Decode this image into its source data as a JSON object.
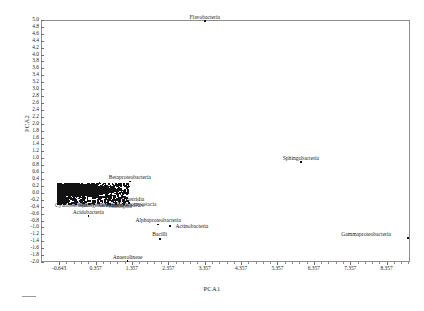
{
  "chart_data": {
    "type": "scatter",
    "title": "",
    "xlabel": "PCA1",
    "ylabel": "PCA2",
    "xlim": [
      -1.143,
      9.0
    ],
    "ylim": [
      -2.0,
      5.0
    ],
    "grid": false,
    "legend": "none",
    "xticks": [
      "-0.643",
      "0.357",
      "1.357",
      "2.357",
      "3.357",
      "4.357",
      "5.357",
      "6.357",
      "7.357",
      "8.357"
    ],
    "xtick_values": [
      -0.643,
      0.357,
      1.357,
      2.357,
      3.357,
      4.357,
      5.357,
      6.357,
      7.357,
      8.357
    ],
    "yticks": [
      "5.0",
      "4.8",
      "4.6",
      "4.4",
      "4.2",
      "4.0",
      "3.8",
      "3.6",
      "3.4",
      "3.2",
      "3.0",
      "2.8",
      "2.6",
      "2.4",
      "2.2",
      "2.0",
      "1.8",
      "1.6",
      "1.4",
      "1.2",
      "1.0",
      "0.8",
      "0.6",
      "0.4",
      "0.2",
      "0.0",
      "-0.2",
      "-0.4",
      "-0.6",
      "-0.8",
      "-1.0",
      "-1.2",
      "-1.4",
      "-1.6",
      "-1.8",
      "-2.0"
    ],
    "ytick_values": [
      5.0,
      4.8,
      4.6,
      4.4,
      4.2,
      4.0,
      3.8,
      3.6,
      3.4,
      3.2,
      3.0,
      2.8,
      2.6,
      2.4,
      2.2,
      2.0,
      1.8,
      1.6,
      1.4,
      1.2,
      1.0,
      0.8,
      0.6,
      0.4,
      0.2,
      0.0,
      -0.2,
      -0.4,
      -0.6,
      -0.8,
      -1.0,
      -1.2,
      -1.4,
      -1.6,
      -1.8,
      -2.0
    ],
    "points": [
      {
        "label": "Flavobacteria",
        "x": 3.357,
        "y": 4.97,
        "label_dx": 0,
        "label_dy": -7
      },
      {
        "label": "Sphingobacteria",
        "x": 6.0,
        "y": 0.9,
        "label_dx": 0,
        "label_dy": -7
      },
      {
        "label": "Gammaproteobacteria",
        "x": 8.95,
        "y": -1.3,
        "label_dx": -42,
        "label_dy": -7
      },
      {
        "label": "Betaproteobacteria",
        "x": 1.3,
        "y": 0.33,
        "label_dx": 0,
        "label_dy": -7
      },
      {
        "label": "Clostridia",
        "x": 1.28,
        "y": -0.3,
        "label_dx": 4,
        "label_dy": -7
      },
      {
        "label": "Acidobacteria",
        "x": 0.16,
        "y": -0.67,
        "label_dx": 0,
        "label_dy": -7
      },
      {
        "label": "Alphaproteobacteria",
        "x": 2.08,
        "y": -0.92,
        "label_dx": 0,
        "label_dy": -8
      },
      {
        "label": "Actinobacteria",
        "x": 2.4,
        "y": -0.96,
        "label_dx": 22,
        "label_dy": -3
      },
      {
        "label": "Bacilli",
        "x": 2.12,
        "y": -1.33,
        "label_dx": 0,
        "label_dy": -8
      },
      {
        "label": "Anaerolineae",
        "x": 1.24,
        "y": -1.97,
        "label_dx": 0,
        "label_dy": -7
      }
    ],
    "cluster": {
      "description": "dense overlapping black point mass near origin with unreadable overplotted taxon labels",
      "x_range": [
        -0.7,
        1.25
      ],
      "y_range": [
        -0.3,
        0.3
      ],
      "visible_label_fragments": [
        "Cyano",
        "Sphingo",
        "Clostridia"
      ]
    }
  },
  "axes": {
    "xlabel": "PCA1",
    "ylabel": "PCA2"
  },
  "caption": {
    "text": ""
  }
}
